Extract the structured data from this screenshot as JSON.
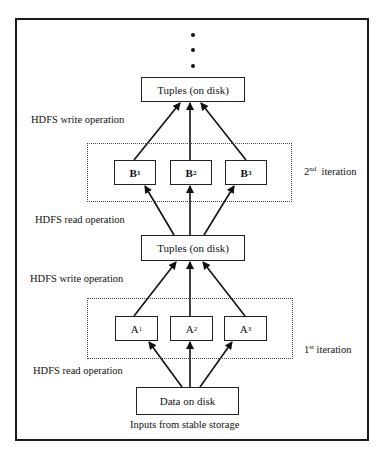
{
  "diagram": {
    "ellipsis_dots": 3,
    "top_output": {
      "label": "Tuples (on disk)"
    },
    "write_label_top": "HDFS write operation",
    "iteration2": {
      "label_ordinal": "2",
      "label_suffix": "nd",
      "label_text": "iteration",
      "tasks": [
        {
          "letter": "B",
          "index": "1"
        },
        {
          "letter": "B",
          "index": "2"
        },
        {
          "letter": "B",
          "index": "3"
        }
      ]
    },
    "read_label_mid": "HDFS read operation",
    "mid_output": {
      "label": "Tuples (on disk)"
    },
    "write_label_mid": "HDFS write operation",
    "iteration1": {
      "label_ordinal": "1",
      "label_suffix": "st",
      "label_text": "iteration",
      "tasks": [
        {
          "letter": "A",
          "index": "1"
        },
        {
          "letter": "A",
          "index": "2"
        },
        {
          "letter": "A",
          "index": "3"
        }
      ]
    },
    "read_label_bottom": "HDFS read operation",
    "input": {
      "label": "Data on disk"
    },
    "input_caption": "Inputs from stable storage"
  }
}
